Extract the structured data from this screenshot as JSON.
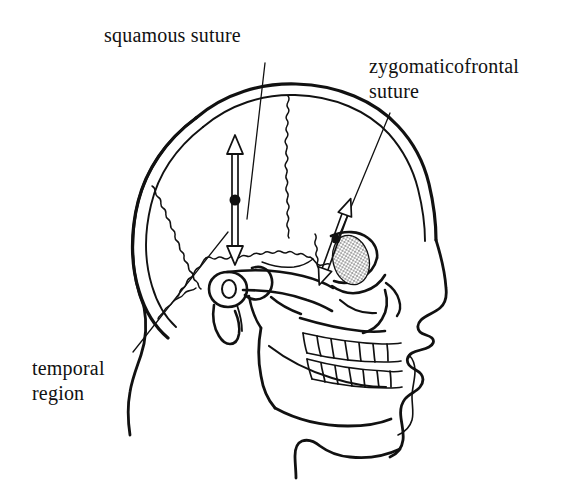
{
  "figure": {
    "kind": "anatomical-line-drawing",
    "background_color": "#ffffff",
    "ink_color": "#111111"
  },
  "labels": {
    "squamous_suture": "squamous suture",
    "zygomaticofrontal_suture": "zygomaticofrontal\nsuture",
    "temporal_region": "temporal\nregion"
  },
  "annotations": {
    "markers": [
      {
        "name": "squamous-suture-marker",
        "x": 235,
        "y": 200,
        "radius": 5.5,
        "arrow": "double-headed",
        "arrow_orientation": "vertical"
      },
      {
        "name": "zygomaticofrontal-suture-marker",
        "x": 336,
        "y": 239,
        "radius": 4.5,
        "arrow": "double-headed",
        "arrow_orientation": "oblique"
      }
    ],
    "leader_lines": [
      {
        "name": "squamous-suture-leader",
        "from": [
          265,
          63
        ],
        "to": [
          247,
          219
        ]
      },
      {
        "name": "zygomaticofrontal-suture-leader",
        "from": [
          390,
          113
        ],
        "to": [
          339,
          236
        ]
      },
      {
        "name": "temporal-region-leader",
        "from": [
          133,
          352
        ],
        "to": [
          228,
          232
        ]
      }
    ]
  }
}
